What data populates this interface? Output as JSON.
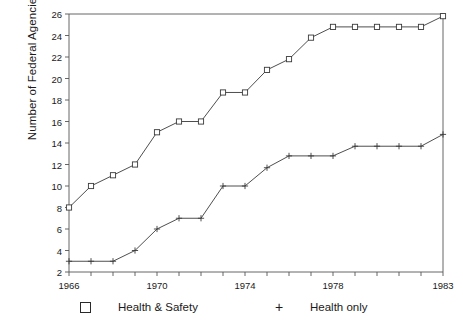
{
  "chart_data": {
    "type": "line",
    "title": "",
    "xlabel": "",
    "ylabel": "Number of Federal Agencies",
    "x": [
      1966,
      1967,
      1968,
      1969,
      1970,
      1971,
      1972,
      1973,
      1974,
      1975,
      1976,
      1977,
      1978,
      1979,
      1980,
      1981,
      1982,
      1983
    ],
    "xlim": [
      1966,
      1983
    ],
    "ylim": [
      2,
      26
    ],
    "xticks": [
      1966,
      1970,
      1974,
      1978,
      1983
    ],
    "xtick_labels": [
      "1966",
      "1970",
      "1974",
      "1978",
      "1983"
    ],
    "yticks": [
      2,
      4,
      6,
      8,
      10,
      12,
      14,
      16,
      18,
      20,
      22,
      24,
      26
    ],
    "ytick_labels": [
      "2",
      "4",
      "6",
      "8",
      "10",
      "12",
      "14",
      "16",
      "18",
      "20",
      "22",
      "24",
      "26"
    ],
    "grid": false,
    "legend_position": "bottom",
    "series": [
      {
        "name": "Health & Safety",
        "marker": "square",
        "color": "#3a3a3a",
        "values": [
          8,
          10,
          11,
          12,
          15,
          16,
          16,
          18.7,
          18.7,
          20.8,
          21.8,
          23.8,
          24.8,
          24.8,
          24.8,
          24.8,
          24.8,
          25.8
        ]
      },
      {
        "name": "Health only",
        "marker": "plus",
        "color": "#3a3a3a",
        "values": [
          3,
          3,
          3,
          4,
          6,
          7,
          7,
          10,
          10,
          11.7,
          12.8,
          12.8,
          12.8,
          13.7,
          13.7,
          13.7,
          13.7,
          14.8
        ]
      }
    ]
  },
  "legend": {
    "items": [
      {
        "label": "Health & Safety",
        "marker": "square-marker"
      },
      {
        "label": "Health only",
        "marker": "plus-marker"
      }
    ]
  }
}
